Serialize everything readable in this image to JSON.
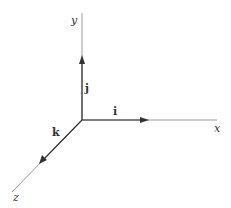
{
  "diagram": {
    "type": "3d-coordinate-axes",
    "origin": [
      82,
      120
    ],
    "axes": [
      {
        "name": "x",
        "label": "x",
        "end": [
          217,
          120
        ]
      },
      {
        "name": "y",
        "label": "y",
        "end": [
          82,
          13
        ]
      },
      {
        "name": "z",
        "label": "z",
        "end": [
          12,
          192
        ]
      }
    ],
    "vectors": [
      {
        "name": "i",
        "label": "i",
        "tip": [
          147,
          120
        ]
      },
      {
        "name": "j",
        "label": "j",
        "tip": [
          82,
          56
        ]
      },
      {
        "name": "k",
        "label": "k",
        "tip": [
          40,
          163
        ]
      }
    ],
    "colors": {
      "axis": "#9a9a9a",
      "vector": "#333333"
    }
  }
}
